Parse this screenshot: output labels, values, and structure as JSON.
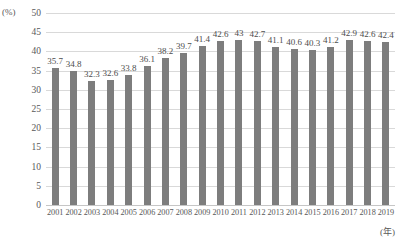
{
  "chart_data": {
    "type": "bar",
    "title": "",
    "xlabel": "(年)",
    "ylabel": "(%)",
    "ylim": [
      0,
      50
    ],
    "ytick_step": 5,
    "yticks": [
      "50",
      "45",
      "40",
      "35",
      "30",
      "25",
      "20",
      "15",
      "10",
      "5",
      "0"
    ],
    "grid": true,
    "legend": "none",
    "bar_color": "#7d7d7d",
    "gridline_color": "#d9d9d9",
    "categories": [
      "2001",
      "2002",
      "2003",
      "2004",
      "2005",
      "2006",
      "2007",
      "2008",
      "2009",
      "2010",
      "2011",
      "2012",
      "2013",
      "2014",
      "2015",
      "2016",
      "2017",
      "2018",
      "2019"
    ],
    "values": [
      35.7,
      34.8,
      32.3,
      32.6,
      33.8,
      36.1,
      38.2,
      39.7,
      41.4,
      42.6,
      43,
      42.7,
      41.1,
      40.6,
      40.3,
      41.2,
      42.9,
      42.6,
      42.4
    ],
    "value_labels": [
      "35.7",
      "34.8",
      "32.3",
      "32.6",
      "33.8",
      "36.1",
      "38.2",
      "39.7",
      "41.4",
      "42.6",
      "43",
      "42.7",
      "41.1",
      "40.6",
      "40.3",
      "41.2",
      "42.9",
      "42.6",
      "42.4"
    ]
  }
}
